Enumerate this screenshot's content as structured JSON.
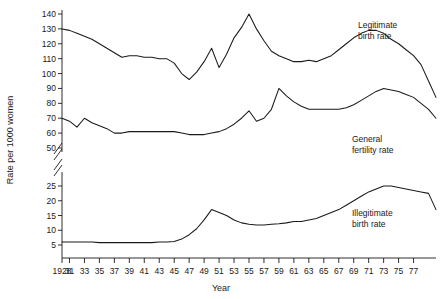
{
  "chart_data": {
    "type": "line",
    "title": "",
    "xlabel": "Year",
    "ylabel": "Rate per 1000 women",
    "grid": false,
    "legend_position": "inline-right",
    "axis_break": {
      "present": true,
      "between": [
        50,
        25
      ],
      "note": "broken y-axis between 50 and 25"
    },
    "yticks_upper": [
      50,
      60,
      70,
      80,
      90,
      100,
      110,
      120,
      130,
      140
    ],
    "yticks_lower": [
      5,
      10,
      15,
      20,
      25
    ],
    "xticks": [
      "1928",
      "31",
      "33",
      "35",
      "37",
      "39",
      "41",
      "43",
      "45",
      "47",
      "49",
      "51",
      "53",
      "55",
      "57",
      "59",
      "61",
      "63",
      "65",
      "67",
      "69",
      "71",
      "73",
      "75",
      "77"
    ],
    "xlim": [
      1928,
      1978
    ],
    "x": [
      1928,
      1929,
      1930,
      1931,
      1932,
      1933,
      1934,
      1935,
      1936,
      1937,
      1938,
      1939,
      1940,
      1941,
      1942,
      1943,
      1944,
      1945,
      1946,
      1947,
      1948,
      1949,
      1950,
      1951,
      1952,
      1953,
      1954,
      1955,
      1956,
      1957,
      1958,
      1959,
      1960,
      1961,
      1962,
      1963,
      1964,
      1965,
      1966,
      1967,
      1968,
      1969,
      1970,
      1971,
      1972,
      1973,
      1974,
      1975,
      1976,
      1977,
      1978
    ],
    "series": [
      {
        "name": "Legitimate birth rate",
        "label_line1": "Legitimate",
        "label_line2": "birth rate",
        "values": [
          130,
          129,
          127,
          125,
          123,
          120,
          117,
          114,
          111,
          112,
          112,
          111,
          111,
          110,
          110,
          107,
          100,
          96,
          101,
          108,
          117,
          104,
          113,
          124,
          131,
          140,
          130,
          122,
          115,
          112,
          110,
          108,
          108,
          109,
          108,
          110,
          112,
          116,
          120,
          124,
          127,
          129,
          129,
          127,
          123,
          120,
          116,
          112,
          106,
          95,
          84
        ]
      },
      {
        "name": "General fertility rate",
        "label_line1": "General",
        "label_line2": "fertility rate",
        "values": [
          70,
          68,
          64,
          70,
          67,
          65,
          63,
          60,
          60,
          61,
          61,
          61,
          61,
          61,
          61,
          61,
          60,
          59,
          59,
          59,
          60,
          61,
          63,
          66,
          70,
          75,
          68,
          70,
          76,
          90,
          85,
          81,
          78,
          76,
          76,
          76,
          76,
          76,
          77,
          79,
          82,
          85,
          88,
          90,
          89,
          88,
          86,
          84,
          80,
          76,
          70
        ]
      },
      {
        "name": "Illegitimate birth rate",
        "label_line1": "Illegitimate",
        "label_line2": "birth rate",
        "values": [
          6,
          6,
          6,
          6,
          6,
          5.8,
          5.8,
          5.8,
          5.8,
          5.8,
          5.8,
          5.8,
          5.8,
          6,
          6,
          6.2,
          7,
          8.5,
          10.5,
          13.5,
          17,
          16,
          15,
          13.5,
          12.5,
          12,
          11.8,
          11.8,
          12,
          12.2,
          12.5,
          13,
          13,
          13.5,
          14,
          15,
          16,
          17,
          18.5,
          20,
          21.5,
          23,
          24,
          25,
          25,
          24.5,
          24,
          23.5,
          23,
          22.5,
          17
        ]
      }
    ]
  },
  "axis": {
    "x_title": "Year",
    "y_title": "Rate per 1000 women"
  }
}
